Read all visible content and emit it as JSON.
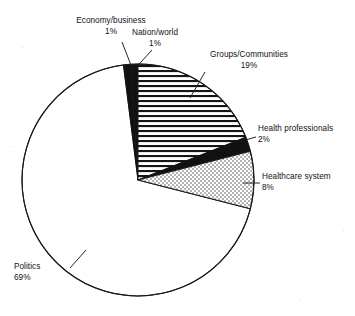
{
  "chart_data": {
    "type": "pie",
    "title": "",
    "subtitle": "",
    "xlabel": "",
    "ylabel": "",
    "grid": false,
    "legend_position": "none",
    "labels_outside": true,
    "units": "percent",
    "total": 100,
    "start_angle_deg": -90,
    "direction": "clockwise",
    "categories": [
      "Nation/world",
      "Groups/Communities",
      "Health professionals",
      "Healthcare system",
      "Politics",
      "Economy/business"
    ],
    "values": [
      1,
      19,
      2,
      8,
      69,
      1
    ],
    "slices": [
      {
        "label": "Nation/world",
        "value": 1,
        "value_text": "1%",
        "fill": "solid-black",
        "fill_color": "#111111"
      },
      {
        "label": "Groups/Communities",
        "value": 19,
        "value_text": "19%",
        "fill": "horizontal-lines",
        "fill_color": "#111111"
      },
      {
        "label": "Health professionals",
        "value": 2,
        "value_text": "2%",
        "fill": "solid-black",
        "fill_color": "#111111"
      },
      {
        "label": "Healthcare system",
        "value": 8,
        "value_text": "8%",
        "fill": "stipple-dots",
        "fill_color": "#444444"
      },
      {
        "label": "Politics",
        "value": 69,
        "value_text": "69%",
        "fill": "white",
        "fill_color": "#ffffff"
      },
      {
        "label": "Economy/business",
        "value": 1,
        "value_text": "1%",
        "fill": "solid-black",
        "fill_color": "#111111"
      }
    ],
    "colors": {
      "outline": "#1a1a1a",
      "background": "#ffffff",
      "text": "#111111"
    }
  },
  "labels": {
    "economy": {
      "name": "Economy/business",
      "pct": "1%"
    },
    "nation": {
      "name": "Nation/world",
      "pct": "1%"
    },
    "groups": {
      "name": "Groups/Communities",
      "pct": "19%"
    },
    "health_professionals": {
      "name": "Health professionals",
      "pct": "2%"
    },
    "healthcare_system": {
      "name": "Healthcare system",
      "pct": "8%"
    },
    "politics": {
      "name": "Politics",
      "pct": "69%"
    }
  }
}
